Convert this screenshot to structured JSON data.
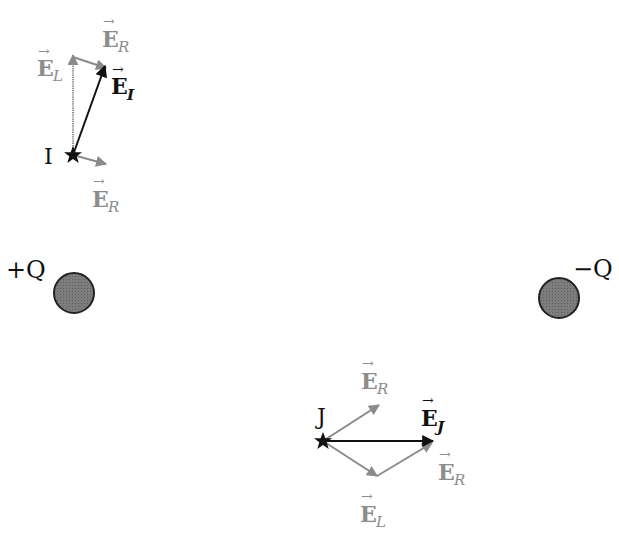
{
  "colors": {
    "black": "#111111",
    "gray_vector": "#8a8a8a",
    "gray_label": "#8c8c8c",
    "charge_fill": "#7a7a7a",
    "charge_stroke": "#222222"
  },
  "charges": {
    "positive": {
      "label": "+Q",
      "cx": 74,
      "cy": 293,
      "r": 20
    },
    "negative": {
      "label": "−Q",
      "cx": 559,
      "cy": 296,
      "r": 20
    }
  },
  "points": {
    "I": {
      "label": "I",
      "x": 73,
      "y": 155
    },
    "J": {
      "label": "J",
      "x": 323,
      "y": 441
    }
  },
  "vectors_I": {
    "E_L": {
      "name": "E",
      "sub": "L",
      "from": [
        73,
        155
      ],
      "to": [
        73,
        55
      ]
    },
    "E_R_top": {
      "name": "E",
      "sub": "R",
      "from": [
        73,
        55
      ],
      "to": [
        106,
        68
      ]
    },
    "E_R_bottom": {
      "name": "E",
      "sub": "R",
      "from": [
        73,
        155
      ],
      "to": [
        106,
        163
      ]
    },
    "E_I": {
      "name": "E",
      "sub": "I",
      "from": [
        73,
        155
      ],
      "to": [
        105,
        68
      ]
    }
  },
  "vectors_J": {
    "E_R_top": {
      "name": "E",
      "sub": "R",
      "from": [
        323,
        441
      ],
      "to": [
        379,
        405
      ]
    },
    "E_L": {
      "name": "E",
      "sub": "L",
      "from": [
        323,
        441
      ],
      "to": [
        377,
        476
      ]
    },
    "E_R_bottom": {
      "name": "E",
      "sub": "R",
      "from": [
        377,
        476
      ],
      "to": [
        432,
        443
      ]
    },
    "E_J": {
      "name": "E",
      "sub": "J",
      "from": [
        323,
        441
      ],
      "to": [
        432,
        441
      ]
    }
  },
  "labels": {
    "I_EL": {
      "name": "E",
      "sub": "L"
    },
    "I_ER_top": {
      "name": "E",
      "sub": "R"
    },
    "I_EI": {
      "name": "E",
      "sub": "I"
    },
    "I_ER_bottom": {
      "name": "E",
      "sub": "R"
    },
    "J_ER_top": {
      "name": "E",
      "sub": "R"
    },
    "J_EJ": {
      "name": "E",
      "sub": "J"
    },
    "J_ER_bottom": {
      "name": "E",
      "sub": "R"
    },
    "J_EL": {
      "name": "E",
      "sub": "L"
    }
  },
  "vector_arrow": "→"
}
